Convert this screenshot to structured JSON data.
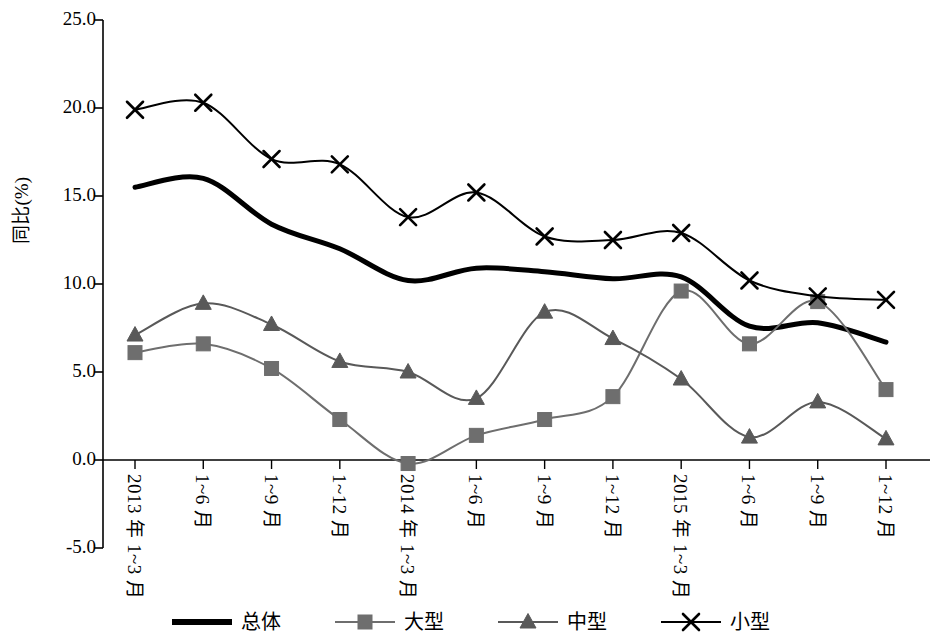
{
  "chart_data": {
    "type": "line",
    "title": "",
    "subtitle": "",
    "xlabel": "",
    "ylabel": "同比(%)",
    "ylim": [
      -5.0,
      25.0
    ],
    "ytick_labels": [
      "25.0",
      "20.0",
      "15.0",
      "10.0",
      "5.0",
      "0.0",
      "-5.0"
    ],
    "ytick_values": [
      25.0,
      20.0,
      15.0,
      10.0,
      5.0,
      0.0,
      -5.0
    ],
    "grid": false,
    "legend_position": "bottom",
    "smooth": true,
    "categories": [
      "2013 年 1~3 月",
      "1~6 月",
      "1~9 月",
      "1~12 月",
      "2014 年 1~3 月",
      "1~6 月",
      "1~9 月",
      "1~12 月",
      "2015 年 1~3 月",
      "1~6 月",
      "1~9 月",
      "1~12 月"
    ],
    "series": [
      {
        "name": "总体",
        "marker": "none",
        "color": "#000000",
        "width": 5,
        "values": [
          15.5,
          16.0,
          13.4,
          12.0,
          10.2,
          10.9,
          10.7,
          10.3,
          10.4,
          7.6,
          7.8,
          6.7
        ]
      },
      {
        "name": "大型",
        "marker": "square",
        "color": "#6e6e6e",
        "width": 2,
        "values": [
          6.1,
          6.6,
          5.2,
          2.3,
          -0.2,
          1.4,
          2.3,
          3.6,
          9.6,
          6.6,
          9.0,
          4.0
        ]
      },
      {
        "name": "中型",
        "marker": "triangle",
        "color": "#595959",
        "width": 2,
        "values": [
          7.1,
          8.9,
          7.7,
          5.6,
          5.0,
          3.5,
          8.4,
          6.9,
          4.6,
          1.3,
          3.3,
          1.2
        ]
      },
      {
        "name": "小型",
        "marker": "x",
        "color": "#000000",
        "width": 2,
        "values": [
          19.9,
          20.3,
          17.1,
          16.8,
          13.8,
          15.2,
          12.7,
          12.5,
          12.9,
          10.2,
          9.3,
          9.1
        ]
      }
    ]
  },
  "legend": {
    "items": [
      {
        "label": "总体",
        "key": "thick-line"
      },
      {
        "label": "大型",
        "key": "square-marker-line"
      },
      {
        "label": "中型",
        "key": "triangle-marker-line"
      },
      {
        "label": "小型",
        "key": "x-marker-line"
      }
    ]
  }
}
